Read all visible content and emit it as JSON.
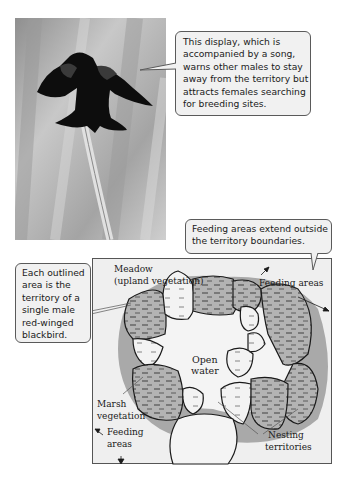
{
  "photo": {
    "subject": "Male red-winged blackbird displaying on a cattail stalk",
    "icon": "bird-photo"
  },
  "callouts": {
    "display": {
      "lines": [
        "This display, which is",
        "accompanied by a song,",
        "warns other males to stay",
        "away from the territory but",
        "attracts females searching",
        "for breeding sites."
      ]
    },
    "feeding": {
      "lines": [
        "Feeding areas extend outside",
        "the territory boundaries."
      ]
    },
    "territory": {
      "lines": [
        "Each outlined",
        "area is the",
        "territory of a",
        "single male",
        "red-winged",
        "blackbird."
      ]
    }
  },
  "map": {
    "labels": {
      "meadow_1": "Meadow",
      "meadow_2": "(upland vegetation)",
      "feeding_top": "Feeding areas",
      "open_1": "Open",
      "open_2": "water",
      "marsh_1": "Marsh",
      "marsh_2": "vegetation",
      "feeding_bottom_1": "Feeding",
      "feeding_bottom_2": "areas",
      "nesting_1": "Nesting",
      "nesting_2": "territories"
    },
    "colors": {
      "background": "#efefef",
      "marsh": "#a9a9a9",
      "territory_fill": "#b5b5b5",
      "open_water": "#f4f4f4",
      "outline": "#1a1a1a"
    }
  }
}
